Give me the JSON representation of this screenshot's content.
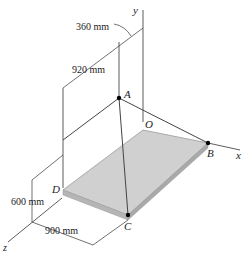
{
  "figure": {
    "type": "3D statics diagram"
  },
  "axes": {
    "x_label": "x",
    "y_label": "y",
    "z_label": "z"
  },
  "points": {
    "A": "A",
    "B": "B",
    "C": "C",
    "D": "D",
    "O": "O"
  },
  "dimensions": {
    "d1": "360 mm",
    "d2": "920 mm",
    "d3": "600 mm",
    "d4": "900 mm"
  },
  "colors": {
    "plate_top": "#cfcfcf",
    "plate_edge": "#a9a9a9",
    "lines": "#333333",
    "points": "#000000"
  }
}
